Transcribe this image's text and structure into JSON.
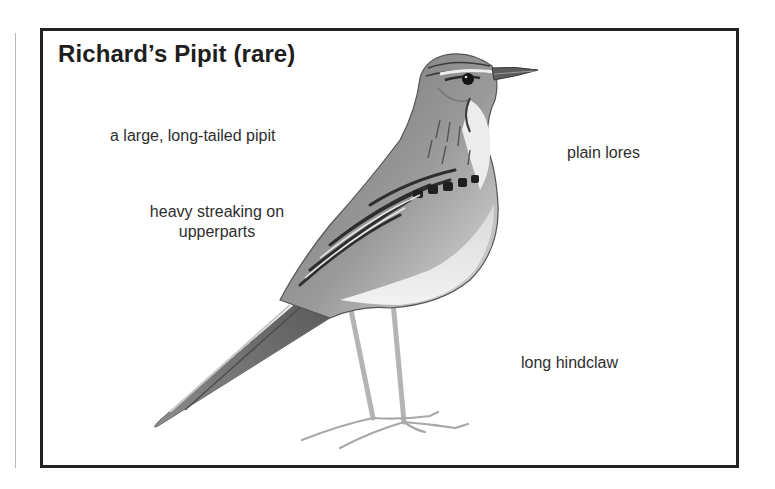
{
  "card": {
    "title": "Richard’s Pipit (rare)",
    "illustration": "richards-pipit-illustration",
    "annotations": [
      {
        "id": "size",
        "text": "a large, long-tailed pipit"
      },
      {
        "id": "streaking_line1",
        "text": "heavy streaking on"
      },
      {
        "id": "streaking_line2",
        "text": "upperparts"
      },
      {
        "id": "lores",
        "text": "plain lores"
      },
      {
        "id": "hindclaw",
        "text": "long hindclaw"
      }
    ]
  },
  "colors": {
    "border": "#222222",
    "text": "#2e2e2e",
    "background": "#ffffff"
  }
}
